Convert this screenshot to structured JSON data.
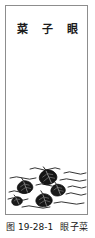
{
  "figure": {
    "plate_title": "菜 子 眼",
    "caption_number": "图 19-28-1",
    "caption_name": "眼子菜",
    "caption_full": "图 19-28-1 眼子菜",
    "frame_border_color": "#8d8d8d",
    "ink_color": "#141414",
    "page_background": "#ffffff"
  },
  "illustration": {
    "subject": "pondweed-floating-leaves",
    "description": "Dark ink-washed floating leaves among horizontal wavy water lines",
    "leaf_count": 5,
    "water_line_count": 11,
    "leaves": [
      {
        "id": "leaf-1",
        "cx": 42,
        "cy": 21,
        "rx": 9,
        "ry": 7.5,
        "rot": -18
      },
      {
        "id": "leaf-2",
        "cx": 19,
        "cy": 31,
        "rx": 8,
        "ry": 6.5,
        "rot": -14
      },
      {
        "id": "leaf-3",
        "cx": 52,
        "cy": 34,
        "rx": 7.5,
        "ry": 6,
        "rot": -16
      },
      {
        "id": "leaf-4",
        "cx": 38,
        "cy": 44,
        "rx": 8.5,
        "ry": 6.5,
        "rot": -12
      },
      {
        "id": "leaf-5",
        "cx": 11,
        "cy": 45,
        "rx": 5.5,
        "ry": 4.5,
        "rot": -20
      }
    ],
    "water_lines": [
      {
        "id": "wave-1",
        "y": 13,
        "x1": 24,
        "x2": 56
      },
      {
        "id": "wave-2",
        "y": 17,
        "x1": 58,
        "x2": 80
      },
      {
        "id": "wave-3",
        "y": 22,
        "x1": 4,
        "x2": 30
      },
      {
        "id": "wave-4",
        "y": 24,
        "x1": 54,
        "x2": 80
      },
      {
        "id": "wave-5",
        "y": 29,
        "x1": 30,
        "x2": 52
      },
      {
        "id": "wave-6",
        "y": 31,
        "x1": 62,
        "x2": 80
      },
      {
        "id": "wave-7",
        "y": 36,
        "x1": 3,
        "x2": 24
      },
      {
        "id": "wave-8",
        "y": 38,
        "x1": 60,
        "x2": 80
      },
      {
        "id": "wave-9",
        "y": 43,
        "x1": 2,
        "x2": 22
      },
      {
        "id": "wave-10",
        "y": 47,
        "x1": 48,
        "x2": 78
      },
      {
        "id": "wave-11",
        "y": 51,
        "x1": 16,
        "x2": 44
      }
    ]
  }
}
